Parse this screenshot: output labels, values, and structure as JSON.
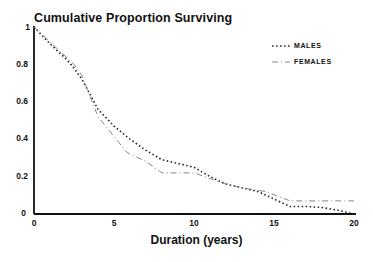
{
  "chart_data": {
    "type": "line",
    "title": "Cumulative Proportion Surviving",
    "xlabel": "Duration (years)",
    "ylabel": "",
    "xlim": [
      0,
      20
    ],
    "ylim": [
      0,
      1
    ],
    "x_ticks": [
      "0",
      "5",
      "10",
      "15",
      "20"
    ],
    "y_ticks": [
      "0",
      "0.2",
      "0.4",
      "0.6",
      "0.8",
      "1"
    ],
    "grid": false,
    "legend_position": "upper right",
    "series": [
      {
        "name": "MALES",
        "style": "dotted",
        "x": [
          0,
          1,
          2,
          2.5,
          3,
          4,
          5,
          6,
          7,
          8,
          9,
          10,
          11,
          12,
          13,
          14,
          15,
          16,
          17,
          18,
          19,
          20
        ],
        "y": [
          1.0,
          0.91,
          0.83,
          0.78,
          0.72,
          0.56,
          0.47,
          0.4,
          0.34,
          0.29,
          0.27,
          0.25,
          0.2,
          0.16,
          0.14,
          0.12,
          0.08,
          0.04,
          0.04,
          0.035,
          0.02,
          0.0
        ]
      },
      {
        "name": "FEMALES",
        "style": "dash-dot",
        "x": [
          0,
          1,
          2,
          2.5,
          3,
          4,
          5.8,
          7,
          8,
          9,
          10,
          11,
          12,
          13,
          14.5,
          16,
          18,
          20
        ],
        "y": [
          1.0,
          0.92,
          0.84,
          0.8,
          0.74,
          0.52,
          0.33,
          0.28,
          0.22,
          0.22,
          0.22,
          0.19,
          0.16,
          0.14,
          0.12,
          0.07,
          0.07,
          0.07
        ]
      }
    ]
  },
  "labels": {
    "title": "Cumulative Proportion Surviving",
    "xlabel": "Duration (years)",
    "legend_males": "MALES",
    "legend_females": "FEMALES",
    "yt0": "0",
    "yt1": "0.2",
    "yt2": "0.4",
    "yt3": "0.6",
    "yt4": "0.8",
    "yt5": "1",
    "xt0": "0",
    "xt1": "5",
    "xt2": "10",
    "xt3": "15",
    "xt4": "20"
  }
}
